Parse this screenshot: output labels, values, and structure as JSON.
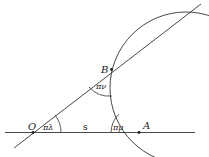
{
  "diagram": {
    "points": {
      "O": "O",
      "A": "A",
      "B": "B"
    },
    "angles": {
      "at_O": "πλ",
      "at_A": "πμ",
      "at_B": "πν"
    },
    "segment_label": "s",
    "stroke_color": "#333333"
  }
}
